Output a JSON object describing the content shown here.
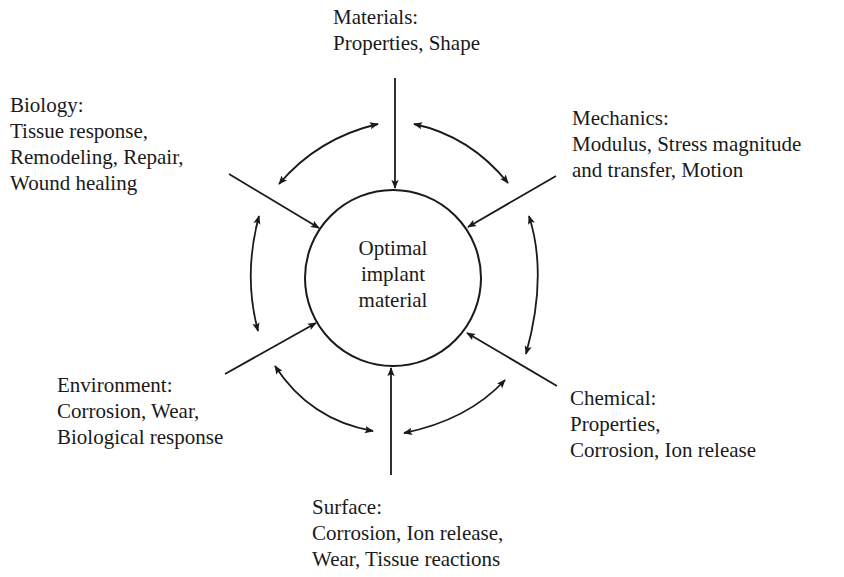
{
  "diagram": {
    "center": {
      "lines": [
        "Optimal",
        "implant",
        "material"
      ]
    },
    "factors": [
      {
        "id": "materials",
        "title": "Materials:",
        "lines": [
          "Properties, Shape"
        ]
      },
      {
        "id": "mechanics",
        "title": "Mechanics:",
        "lines": [
          "Modulus, Stress magnitude",
          "and transfer, Motion"
        ]
      },
      {
        "id": "chemical",
        "title": "Chemical:",
        "lines": [
          "Properties,",
          "Corrosion, Ion release"
        ]
      },
      {
        "id": "surface",
        "title": "Surface:",
        "lines": [
          "Corrosion, Ion release,",
          "Wear, Tissue reactions"
        ]
      },
      {
        "id": "environment",
        "title": "Environment:",
        "lines": [
          "Corrosion, Wear,",
          "Biological response"
        ]
      },
      {
        "id": "biology",
        "title": "Biology:",
        "lines": [
          "Tissue response,",
          "Remodeling, Repair,",
          "Wound healing"
        ]
      }
    ],
    "relations": [
      {
        "from": "materials",
        "to": "center",
        "type": "directed"
      },
      {
        "from": "mechanics",
        "to": "center",
        "type": "directed"
      },
      {
        "from": "chemical",
        "to": "center",
        "type": "directed"
      },
      {
        "from": "surface",
        "to": "center",
        "type": "directed"
      },
      {
        "from": "environment",
        "to": "center",
        "type": "directed"
      },
      {
        "from": "biology",
        "to": "center",
        "type": "directed"
      },
      {
        "between": [
          "biology",
          "materials"
        ],
        "type": "bidirectional"
      },
      {
        "between": [
          "materials",
          "mechanics"
        ],
        "type": "bidirectional"
      },
      {
        "between": [
          "mechanics",
          "chemical"
        ],
        "type": "bidirectional"
      },
      {
        "between": [
          "chemical",
          "surface"
        ],
        "type": "bidirectional"
      },
      {
        "between": [
          "surface",
          "environment"
        ],
        "type": "bidirectional"
      },
      {
        "between": [
          "environment",
          "biology"
        ],
        "type": "bidirectional"
      }
    ],
    "colors": {
      "ink": "#1a1a1a",
      "background": "#ffffff"
    }
  }
}
